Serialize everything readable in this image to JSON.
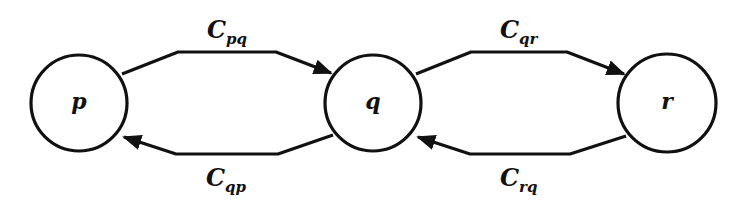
{
  "diagram": {
    "type": "state-transition",
    "nodes": [
      {
        "id": "p",
        "label": "p",
        "cx": 79,
        "cy": 103,
        "r": 48
      },
      {
        "id": "q",
        "label": "q",
        "cx": 373,
        "cy": 103,
        "r": 48
      },
      {
        "id": "r",
        "label": "r",
        "cx": 667,
        "cy": 103,
        "r": 49
      }
    ],
    "edges": [
      {
        "id": "pq",
        "from": "p",
        "to": "q",
        "label_main": "C",
        "label_sub": "pq"
      },
      {
        "id": "qp",
        "from": "q",
        "to": "p",
        "label_main": "C",
        "label_sub": "qp"
      },
      {
        "id": "qr",
        "from": "q",
        "to": "r",
        "label_main": "C",
        "label_sub": "qr"
      },
      {
        "id": "rq",
        "from": "r",
        "to": "q",
        "label_main": "C",
        "label_sub": "rq"
      }
    ],
    "colors": {
      "stroke": "#111111",
      "background": "#ffffff"
    }
  }
}
